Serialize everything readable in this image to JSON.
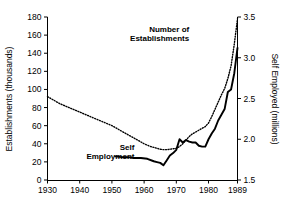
{
  "chart_data": {
    "type": "line",
    "title": "",
    "xlabel": "",
    "ylabel": "Establishments (thousands)",
    "y2label": "Self Employed (millions)",
    "grid": false,
    "legend_position": "inline-annotations",
    "xlim": [
      1930,
      1989
    ],
    "xticks": [
      1930,
      1940,
      1950,
      1960,
      1970,
      1980,
      1989
    ],
    "xticklabels": [
      "1930",
      "1940",
      "1950",
      "1960",
      "1970",
      "1980",
      "1989"
    ],
    "ylim": [
      0,
      180
    ],
    "yticks": [
      0,
      20,
      40,
      60,
      80,
      100,
      120,
      140,
      160,
      180
    ],
    "yticklabels": [
      "0",
      "20",
      "40",
      "60",
      "80",
      "100",
      "120",
      "140",
      "160",
      "180"
    ],
    "y2lim": [
      1.5,
      3.5
    ],
    "y2ticks": [
      1.5,
      2.0,
      2.5,
      3.0,
      3.5
    ],
    "y2ticklabels": [
      "1.5",
      "2.0",
      "2.5",
      "3.0",
      "3.5"
    ],
    "series": [
      {
        "name": "Number of Establishments",
        "axis": "left",
        "style": "dotted",
        "color": "#000000",
        "x": [
          1930,
          1932,
          1934,
          1936,
          1938,
          1940,
          1942,
          1944,
          1946,
          1948,
          1950,
          1952,
          1954,
          1956,
          1958,
          1960,
          1962,
          1964,
          1965,
          1966,
          1967,
          1968,
          1969,
          1970,
          1971,
          1972,
          1973,
          1974,
          1975,
          1976,
          1977,
          1978,
          1979,
          1980,
          1981,
          1982,
          1983,
          1984,
          1985,
          1986,
          1987,
          1988,
          1989
        ],
        "values": [
          92,
          88,
          84,
          81,
          78,
          75,
          72,
          69,
          66,
          63,
          60,
          56,
          52,
          48,
          44,
          40,
          37,
          35,
          34,
          33.5,
          33.5,
          34,
          34.5,
          35,
          37,
          40,
          44,
          48,
          51,
          53,
          55,
          57,
          59,
          63,
          70,
          78,
          86,
          94,
          101,
          112,
          126,
          150,
          178
        ]
      },
      {
        "name": "Self Employment",
        "axis": "right",
        "style": "solid",
        "color": "#000000",
        "x": [
          1951,
          1953,
          1955,
          1957,
          1959,
          1961,
          1963,
          1964,
          1965,
          1966,
          1967,
          1968,
          1969,
          1970,
          1971,
          1972,
          1973,
          1974,
          1975,
          1976,
          1977,
          1978,
          1979,
          1980,
          1981,
          1982,
          1983,
          1984,
          1985,
          1986,
          1987,
          1988,
          1989
        ],
        "values_left_scale": [
          26,
          25.5,
          25,
          24.5,
          24,
          23,
          21,
          20,
          18.5,
          16,
          22,
          27,
          30,
          33,
          45,
          41,
          44,
          42,
          41,
          41,
          38,
          37,
          37,
          45,
          51,
          57,
          66,
          72,
          78,
          97,
          100,
          118,
          146
        ],
        "values": [
          1.79,
          1.78,
          1.78,
          1.77,
          1.77,
          1.76,
          1.73,
          1.72,
          1.71,
          1.68,
          1.74,
          1.8,
          1.83,
          1.87,
          2.0,
          1.96,
          1.99,
          1.97,
          1.96,
          1.96,
          1.92,
          1.91,
          1.91,
          2.0,
          2.07,
          2.13,
          2.23,
          2.3,
          2.37,
          2.58,
          2.61,
          2.81,
          3.12
        ]
      }
    ],
    "annotations": [
      {
        "id": "establishments-label",
        "text_lines": [
          "Number of",
          "Establishments"
        ],
        "x": 1974,
        "y": 163
      },
      {
        "id": "self-employment-label",
        "text_lines": [
          "Self",
          "Employment"
        ],
        "x": 1957,
        "y": 33
      }
    ]
  },
  "axes": {
    "left_title": "Establishments (thousands)",
    "right_title": "Self Employed (millions)"
  }
}
